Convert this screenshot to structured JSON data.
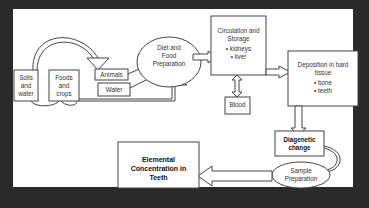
{
  "diagram": {
    "nodes": {
      "soils": {
        "label_lines": [
          "Soils",
          "and",
          "water"
        ]
      },
      "foods": {
        "label_lines": [
          "Foods",
          "and",
          "crops"
        ]
      },
      "animals": {
        "label": "Animals"
      },
      "water": {
        "label": "Water"
      },
      "diet": {
        "label_lines": [
          "Diet and",
          "Food",
          "Preparation"
        ]
      },
      "circulation": {
        "label_lines": [
          "Circulation and",
          "Storage"
        ],
        "items": [
          "kidneys",
          "liver"
        ]
      },
      "blood": {
        "label": "Blood"
      },
      "deposition": {
        "label_lines": [
          "Deposition in hard",
          "tissue"
        ],
        "items": [
          "bone",
          "teeth"
        ]
      },
      "diagenetic": {
        "label_lines": [
          "Diagenetic",
          "change"
        ]
      },
      "sample": {
        "label_lines": [
          "Sample",
          "Preparation"
        ]
      },
      "elemental": {
        "label_lines": [
          "Elemental",
          "Concentration in",
          "Teeth"
        ]
      }
    },
    "edges": [
      {
        "from": "Soils and water",
        "to": "Animals",
        "type": "curved block arrow"
      },
      {
        "from": "Soils and water",
        "to": "Foods and crops",
        "type": "loop"
      },
      {
        "from": "Animals",
        "to": "Diet and Food Preparation",
        "type": "line arrow"
      },
      {
        "from": "Water",
        "to": "Diet and Food Preparation",
        "type": "line arrow"
      },
      {
        "from": "Foods and crops",
        "to": "Diet and Food Preparation",
        "type": "block arrow"
      },
      {
        "from": "Diet and Food Preparation",
        "to": "Circulation and Storage",
        "type": "block arrow"
      },
      {
        "from": "Circulation and Storage",
        "to": "Blood",
        "type": "double block arrow"
      },
      {
        "from": "Circulation and Storage",
        "to": "Deposition in hard tissue",
        "type": "block arrow"
      },
      {
        "from": "Deposition in hard tissue",
        "to": "Diagenetic change",
        "type": "block arrow"
      },
      {
        "from": "Diagenetic change",
        "to": "Sample Preparation",
        "type": "curved block arrow"
      },
      {
        "from": "Sample Preparation",
        "to": "Elemental Concentration in Teeth",
        "type": "block arrow"
      }
    ]
  },
  "colors": {
    "background": "#2a2a2a",
    "panel": "#ffffff",
    "stroke": "#444444",
    "text": "#333333"
  }
}
